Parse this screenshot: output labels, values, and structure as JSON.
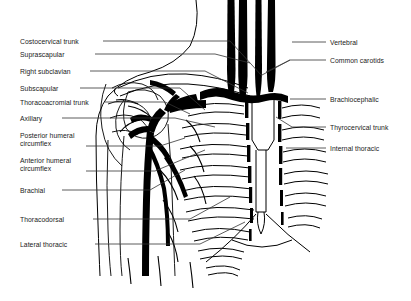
{
  "figure": {
    "type": "anatomical-line-diagram",
    "background_color": "#ffffff",
    "ink_color": "#000000",
    "leader_color": "#333333"
  },
  "labels_left": [
    {
      "id": "costocervical-trunk",
      "text": "Costocervical trunk",
      "x": 20,
      "y": 38,
      "lines": 1
    },
    {
      "id": "suprascapular",
      "text": "Suprascapular",
      "x": 20,
      "y": 51,
      "lines": 1
    },
    {
      "id": "right-subclavian",
      "text": "Right subclavian",
      "x": 20,
      "y": 68,
      "lines": 1
    },
    {
      "id": "subscapular",
      "text": "Subscapular",
      "x": 20,
      "y": 85,
      "lines": 1
    },
    {
      "id": "thoracoacromial-trunk",
      "text": "Thoracoacromial trunk",
      "x": 20,
      "y": 99,
      "lines": 1
    },
    {
      "id": "axillary",
      "text": "Axillary",
      "x": 20,
      "y": 115,
      "lines": 1
    },
    {
      "id": "posterior-humeral-circumflex",
      "text": "Posterior humeral\ncircumflex",
      "x": 20,
      "y": 132,
      "lines": 2
    },
    {
      "id": "anterior-humeral-circumflex",
      "text": "Anterior humeral\ncircumflex",
      "x": 20,
      "y": 157,
      "lines": 2
    },
    {
      "id": "brachial",
      "text": "Brachial",
      "x": 20,
      "y": 187,
      "lines": 1
    },
    {
      "id": "thoracodorsal",
      "text": "Thoracodorsal",
      "x": 20,
      "y": 216,
      "lines": 1
    },
    {
      "id": "lateral-thoracic",
      "text": "Lateral thoracic",
      "x": 20,
      "y": 241,
      "lines": 1
    }
  ],
  "labels_right": [
    {
      "id": "vertebral",
      "text": "Vertebral",
      "x": 330,
      "y": 39,
      "lines": 1
    },
    {
      "id": "common-carotids",
      "text": "Common carotids",
      "x": 330,
      "y": 57,
      "lines": 1
    },
    {
      "id": "brachiocephalic",
      "text": "Brachiocephalic",
      "x": 330,
      "y": 96,
      "lines": 1
    },
    {
      "id": "thyrocervical-trunk",
      "text": "Thyrocervical trunk",
      "x": 330,
      "y": 124,
      "lines": 1
    },
    {
      "id": "internal-thoracic",
      "text": "Internal thoracic",
      "x": 330,
      "y": 145,
      "lines": 1
    }
  ],
  "leaders_left": [
    {
      "id": "leader-costocervical-trunk",
      "points": "103,41 230,41 262,76"
    },
    {
      "id": "leader-suprascapular",
      "points": "95,54 215,54 250,63"
    },
    {
      "id": "leader-right-subclavian",
      "points": "90,71 205,71 248,93"
    },
    {
      "id": "leader-subscapular",
      "points": "80,88 180,88 205,110"
    },
    {
      "id": "leader-thoracoacromial-trunk",
      "points": "105,102 165,102 190,114"
    },
    {
      "id": "leader-axillary",
      "points": "62,118 175,118 215,127"
    },
    {
      "id": "leader-posterior-humeral",
      "points": "86,146 160,146 185,138"
    },
    {
      "id": "leader-anterior-humeral",
      "points": "86,171 155,171 205,150"
    },
    {
      "id": "leader-brachial",
      "points": "62,190 150,190 185,170"
    },
    {
      "id": "leader-thoracodorsal",
      "points": "93,219 190,219 230,197"
    },
    {
      "id": "leader-lateral-thoracic",
      "points": "95,244 200,244 245,222"
    }
  ],
  "leaders_right": [
    {
      "id": "leader-vertebral",
      "points": "326,42 292,42"
    },
    {
      "id": "leader-common-carotids-a",
      "points": "326,60 290,60"
    },
    {
      "id": "leader-common-carotids-b",
      "points": "290,60 262,75"
    },
    {
      "id": "leader-brachiocephalic",
      "points": "326,99 290,99"
    },
    {
      "id": "leader-thyrocervical-trunk",
      "points": "326,127 292,127 278,118"
    },
    {
      "id": "leader-internal-thoracic",
      "points": "326,148 290,148"
    }
  ],
  "illustration": {
    "great_vessels": [
      {
        "id": "vessel-trunk-1",
        "x": 230,
        "top": 0,
        "bottom": 96,
        "width": 6.5
      },
      {
        "id": "vessel-trunk-2",
        "x": 242,
        "top": 0,
        "bottom": 98,
        "width": 7.5
      },
      {
        "id": "vessel-trunk-3",
        "x": 258,
        "top": 0,
        "bottom": 96,
        "width": 6.0
      },
      {
        "id": "vessel-trunk-4",
        "x": 272,
        "top": 0,
        "bottom": 92,
        "width": 7.0
      }
    ],
    "ribs_left_count": 9,
    "ribs_right_count": 6,
    "internal_thoracic_bar_count": 7,
    "sternum_present": true,
    "clavicle_present": true,
    "scapula_present": true,
    "humerus_present": true
  }
}
